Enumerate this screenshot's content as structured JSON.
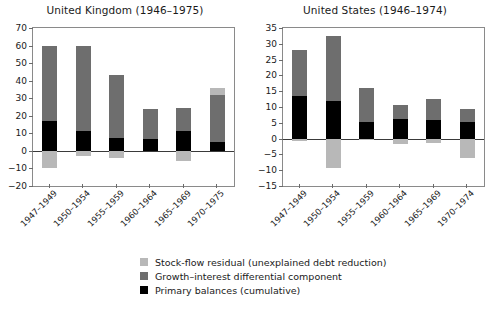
{
  "legend": {
    "items": [
      {
        "label": "Stock-flow residual (unexplained debt reduction)",
        "color": "#b8b8b8",
        "key": "residual"
      },
      {
        "label": "Growth–interest differential component",
        "color": "#6e6e6e",
        "key": "growth"
      },
      {
        "label": "Primary balances (cumulative)",
        "color": "#000000",
        "key": "primary"
      }
    ]
  },
  "chart_data": [
    {
      "type": "bar",
      "id": "united-kingdom",
      "title": "United Kingdom (1946–1975)",
      "xlabel": "",
      "ylabel": "",
      "ylim": [
        -20,
        70
      ],
      "yticks": [
        70,
        60,
        50,
        40,
        30,
        20,
        10,
        0,
        -10,
        -20
      ],
      "ytick_labels": [
        "70",
        "60",
        "50",
        "40",
        "30",
        "20",
        "10",
        "0",
        "−10",
        "−20"
      ],
      "grid": false,
      "stacked": true,
      "legend_position": "bottom",
      "categories": [
        "1947–1949",
        "1950–1954",
        "1955–1959",
        "1960–1964",
        "1965–1969",
        "1970–1975"
      ],
      "series": [
        {
          "name": "Primary balances (cumulative)",
          "color": "#000000",
          "values": [
            17.0,
            11.5,
            7.5,
            7.0,
            11.5,
            5.0
          ]
        },
        {
          "name": "Growth–interest differential component",
          "color": "#6e6e6e",
          "values": [
            43.0,
            48.5,
            35.5,
            17.0,
            13.0,
            27.0
          ]
        },
        {
          "name": "Stock-flow residual (unexplained debt reduction)",
          "color": "#b8b8b8",
          "values": [
            -10.0,
            -3.0,
            -4.0,
            0.0,
            -6.0,
            4.0
          ]
        }
      ],
      "bar_tops": [
        60.0,
        60.0,
        43.0,
        24.0,
        24.5,
        36.0
      ]
    },
    {
      "type": "bar",
      "id": "united-states",
      "title": "United States (1946–1974)",
      "xlabel": "",
      "ylabel": "",
      "ylim": [
        -15,
        35
      ],
      "yticks": [
        35,
        30,
        25,
        20,
        15,
        10,
        5,
        0,
        -5,
        -10,
        -15
      ],
      "ytick_labels": [
        "35",
        "30",
        "25",
        "20",
        "15",
        "10",
        "5",
        "0",
        "−5",
        "−10",
        "−15"
      ],
      "grid": false,
      "stacked": true,
      "legend_position": "bottom",
      "categories": [
        "1947–1949",
        "1950–1954",
        "1955–1959",
        "1960–1964",
        "1965–1969",
        "1970–1974"
      ],
      "series": [
        {
          "name": "Primary balances (cumulative)",
          "color": "#000000",
          "values": [
            13.5,
            12.0,
            5.4,
            6.1,
            5.8,
            5.4
          ]
        },
        {
          "name": "Growth–interest differential component",
          "color": "#6e6e6e",
          "values": [
            14.5,
            20.5,
            10.5,
            4.6,
            6.7,
            3.9
          ]
        },
        {
          "name": "Stock-flow residual (unexplained debt reduction)",
          "color": "#b8b8b8",
          "values": [
            -0.9,
            -9.4,
            -0.6,
            -1.6,
            -1.5,
            -6.0
          ]
        }
      ],
      "bar_tops": [
        28.0,
        32.5,
        15.9,
        10.7,
        12.5,
        9.3
      ]
    }
  ]
}
